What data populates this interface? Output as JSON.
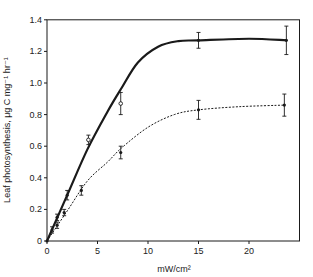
{
  "chart_data": {
    "type": "line",
    "title": "",
    "xlabel": "mW/cm²",
    "ylabel": "Leaf photosynthesis, μg C mg⁻¹ hr⁻¹",
    "xlim": [
      0,
      25
    ],
    "ylim": [
      0,
      1.4
    ],
    "x_ticks": [
      0,
      5,
      10,
      15,
      20
    ],
    "y_ticks": [
      0,
      0.2,
      0.4,
      0.6,
      0.8,
      1.0,
      1.2,
      1.4
    ],
    "x_tick_labels": [
      "0",
      "5",
      "10",
      "15",
      "20"
    ],
    "y_tick_labels": [
      "0",
      "0.2",
      "0.4",
      "0.6",
      "0.8",
      "1.0",
      "1.2",
      "1.4"
    ],
    "grid": false,
    "legend": null,
    "series": [
      {
        "name": "upper (solid curve)",
        "line_style": "solid",
        "curve": [
          [
            0,
            0
          ],
          [
            2,
            0.29
          ],
          [
            4,
            0.58
          ],
          [
            6,
            0.82
          ],
          [
            7.4,
            0.97
          ],
          [
            9,
            1.13
          ],
          [
            11,
            1.23
          ],
          [
            13,
            1.265
          ],
          [
            15,
            1.27
          ],
          [
            20,
            1.28
          ],
          [
            23.7,
            1.27
          ]
        ],
        "points": [
          {
            "x": 0,
            "y": 0,
            "marker": "filled",
            "err": 0
          },
          {
            "x": 0.5,
            "y": 0.07,
            "marker": "filled",
            "err": 0.02
          },
          {
            "x": 1.0,
            "y": 0.15,
            "marker": "filled",
            "err": 0.02
          },
          {
            "x": 2.0,
            "y": 0.29,
            "marker": "filled",
            "err": 0.03
          },
          {
            "x": 4.1,
            "y": 0.64,
            "marker": "open",
            "err": 0.03
          },
          {
            "x": 7.3,
            "y": 0.87,
            "marker": "open",
            "err": 0.07
          },
          {
            "x": 15.0,
            "y": 1.27,
            "marker": "filled",
            "err": 0.05
          },
          {
            "x": 23.7,
            "y": 1.27,
            "marker": "filled",
            "err": 0.09
          }
        ]
      },
      {
        "name": "lower (dashed curve)",
        "line_style": "dashed",
        "curve": [
          [
            0,
            0
          ],
          [
            2,
            0.19
          ],
          [
            4,
            0.38
          ],
          [
            6,
            0.5
          ],
          [
            7.4,
            0.59
          ],
          [
            10,
            0.72
          ],
          [
            12.6,
            0.8
          ],
          [
            15,
            0.83
          ],
          [
            19,
            0.85
          ],
          [
            23.5,
            0.86
          ]
        ],
        "points": [
          {
            "x": 1.0,
            "y": 0.1,
            "marker": "filled",
            "err": 0.02
          },
          {
            "x": 1.7,
            "y": 0.18,
            "marker": "filled",
            "err": 0.02
          },
          {
            "x": 3.4,
            "y": 0.32,
            "marker": "filled",
            "err": 0.03
          },
          {
            "x": 7.3,
            "y": 0.56,
            "marker": "filled",
            "err": 0.04
          },
          {
            "x": 15.0,
            "y": 0.83,
            "marker": "filled",
            "err": 0.06
          },
          {
            "x": 23.5,
            "y": 0.86,
            "marker": "filled",
            "err": 0.07
          }
        ]
      }
    ]
  },
  "colors": {
    "line": "#1a1a1a",
    "background": "#ffffff"
  }
}
